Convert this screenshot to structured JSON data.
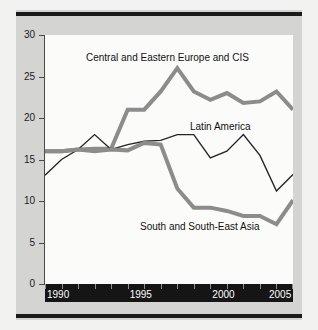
{
  "chart_data": {
    "type": "line",
    "title": "",
    "subtitle": "",
    "xlabel": "",
    "ylabel": "",
    "xlim": [
      1990,
      2005
    ],
    "ylim": [
      0,
      30
    ],
    "xticks": [
      1990,
      1995,
      2000,
      2005
    ],
    "xtick_labels": [
      "1990",
      "1995",
      "2000",
      "2005"
    ],
    "yticks": [
      0,
      5,
      10,
      15,
      20,
      25,
      30
    ],
    "ytick_labels": [
      "0",
      "5",
      "10",
      "15",
      "20",
      "25",
      "30"
    ],
    "grid": false,
    "legend_position": "inline-annotations",
    "x": [
      1990,
      1991,
      1992,
      1993,
      1994,
      1995,
      1996,
      1997,
      1998,
      1999,
      2000,
      2001,
      2002,
      2003,
      2004,
      2005
    ],
    "series": [
      {
        "name": "Central and Eastern Europe and CIS",
        "color": "#8c8c8c",
        "width": 4,
        "values": [
          16.0,
          16.0,
          16.2,
          16.3,
          16.3,
          21.0,
          21.0,
          23.2,
          26.0,
          23.2,
          22.2,
          23.0,
          21.8,
          22.0,
          23.2,
          21.0
        ]
      },
      {
        "name": "Latin America",
        "color": "#262626",
        "width": 1.4,
        "values": [
          13.1,
          15.0,
          16.2,
          18.0,
          16.2,
          16.8,
          17.2,
          17.3,
          18.0,
          18.0,
          15.2,
          16.0,
          18.0,
          15.5,
          11.2,
          13.2
        ]
      },
      {
        "name": "South and South-East Asia",
        "color": "#8c8c8c",
        "width": 4,
        "values": [
          16.0,
          16.0,
          16.2,
          16.0,
          16.2,
          16.1,
          17.0,
          16.8,
          11.5,
          9.2,
          9.2,
          8.8,
          8.2,
          8.2,
          7.2,
          10.1
        ]
      }
    ],
    "annotations": [
      {
        "text": "Central and Eastern Europe and CIS"
      },
      {
        "text": "Latin America"
      },
      {
        "text": "South and South-East Asia"
      }
    ]
  },
  "figure": {
    "background_color": "#d4d4d2",
    "plot_background_color": "#fbfbfa",
    "axis_band_color": "#151515",
    "rule_color": "#1b1b1b"
  }
}
